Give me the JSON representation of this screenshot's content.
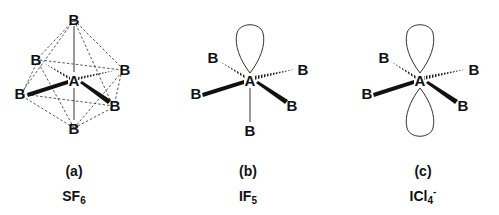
{
  "panels": [
    {
      "id": "a",
      "label": "(a)",
      "formula_base": "SF",
      "formula_sub": "6",
      "formula_sup": "",
      "center_atom": "A",
      "ligand_atom": "B",
      "geometry": "octahedral",
      "ligand_count": 6,
      "lone_pairs": 0
    },
    {
      "id": "b",
      "label": "(b)",
      "formula_base": "IF",
      "formula_sub": "5",
      "formula_sup": "",
      "center_atom": "A",
      "ligand_atom": "B",
      "geometry": "square pyramidal",
      "ligand_count": 5,
      "lone_pairs": 1
    },
    {
      "id": "c",
      "label": "(c)",
      "formula_base": "ICl",
      "formula_sub": "4",
      "formula_sup": "-",
      "center_atom": "A",
      "ligand_atom": "B",
      "geometry": "square planar",
      "ligand_count": 4,
      "lone_pairs": 2
    }
  ],
  "atoms": {
    "center": "A",
    "ligand": "B"
  }
}
